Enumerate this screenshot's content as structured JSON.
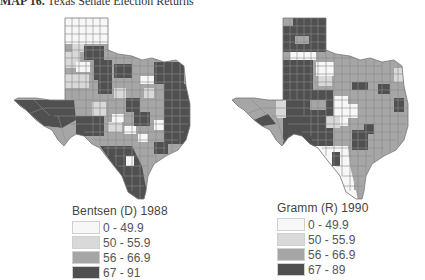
{
  "title": {
    "lead": "MAP 16.",
    "text": "Texas Senate Election Returns"
  },
  "colors": {
    "bin0": "#f7f7f7",
    "bin1": "#d9d9d9",
    "bin2": "#a6a6a6",
    "bin3": "#505050",
    "outline": "#8a8a8a"
  },
  "maps": [
    {
      "id": "bentsen",
      "legend_title": "Bentsen  (D) 1988",
      "bins": [
        {
          "label": "0 - 49.9"
        },
        {
          "label": "50 - 55.9"
        },
        {
          "label": "56 - 66.9"
        },
        {
          "label": "67 - 91"
        }
      ]
    },
    {
      "id": "gramm",
      "legend_title": "Gramm  (R) 1990",
      "bins": [
        {
          "label": "0 - 49.9"
        },
        {
          "label": "50 - 55.9"
        },
        {
          "label": "56 - 66.9"
        },
        {
          "label": "67 - 89"
        }
      ]
    }
  ]
}
